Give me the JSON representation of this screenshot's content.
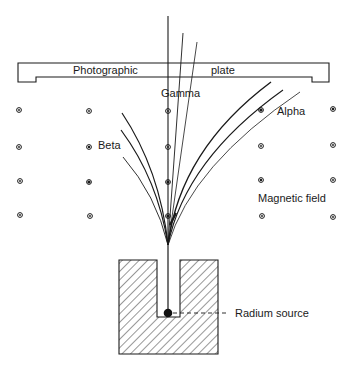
{
  "diagram": {
    "type": "physics-schematic",
    "colors": {
      "ink": "#1a1a1a",
      "background": "#ffffff"
    },
    "labels": {
      "plate_left": "Photographic",
      "plate_right": "plate",
      "gamma": "Gamma",
      "alpha": "Alpha",
      "beta": "Beta",
      "magnetic_field": "Magnetic field",
      "radium_source": "Radium source"
    },
    "field_symbol": "circled-dot (field out of page)",
    "field_grid": {
      "columns_x": [
        19,
        89,
        168,
        261,
        333
      ],
      "rows_y": [
        110,
        147,
        182,
        216
      ]
    },
    "beams": {
      "gamma": {
        "count": 3,
        "deflection": "none / slight"
      },
      "alpha": {
        "count": 3,
        "deflection": "right"
      },
      "beta": {
        "count": 3,
        "deflection": "left"
      }
    }
  }
}
